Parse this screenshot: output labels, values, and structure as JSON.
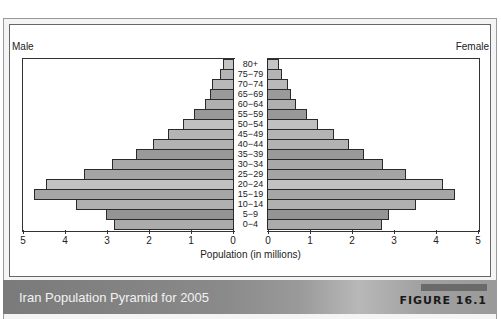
{
  "chart_data": {
    "type": "bar",
    "subtype": "population-pyramid",
    "title": "Iran Population Pyramid for 2005",
    "figure_label": "FIGURE 16.1",
    "xlabel": "Population (in millions)",
    "ylabel": "",
    "xlim": [
      0,
      5
    ],
    "x_ticks_left": [
      "5",
      "4",
      "3",
      "2",
      "1",
      "0"
    ],
    "x_ticks_right": [
      "0",
      "1",
      "2",
      "3",
      "4",
      "5"
    ],
    "legend": {
      "left": "Male",
      "right": "Female"
    },
    "grid": false,
    "categories": [
      "80+",
      "75−79",
      "70−74",
      "65−69",
      "60−64",
      "55−59",
      "50−54",
      "45−49",
      "40−44",
      "35−39",
      "30−34",
      "25−29",
      "20−24",
      "15−19",
      "10−14",
      "5−9",
      "0−4"
    ],
    "series": [
      {
        "name": "Male",
        "values": [
          0.27,
          0.33,
          0.52,
          0.57,
          0.69,
          0.95,
          1.21,
          1.57,
          1.93,
          2.33,
          2.9,
          3.57,
          4.48,
          4.76,
          3.76,
          3.05,
          2.86
        ]
      },
      {
        "name": "Female",
        "values": [
          0.29,
          0.36,
          0.5,
          0.57,
          0.69,
          0.95,
          1.21,
          1.6,
          1.95,
          2.31,
          2.76,
          3.31,
          4.19,
          4.48,
          3.55,
          2.9,
          2.74
        ]
      }
    ],
    "bar_colors": [
      "#c4c4c4",
      "#b4b4b4",
      "#b9b9b9",
      "#9a9a9a",
      "#b0b0b0",
      "#989898",
      "#c0c0c0",
      "#b4b4b4",
      "#b2b2b2",
      "#999999",
      "#a8a8a8",
      "#a4a4a4",
      "#c2c2c2",
      "#a6a6a6",
      "#b0b0b0",
      "#949494",
      "#ababab"
    ]
  },
  "labels": {
    "male": "Male",
    "female": "Female",
    "xlabel": "Population (in millions)"
  },
  "footer": {
    "title": "Iran Population Pyramid for 2005",
    "figure": "FIGURE 16.1"
  }
}
